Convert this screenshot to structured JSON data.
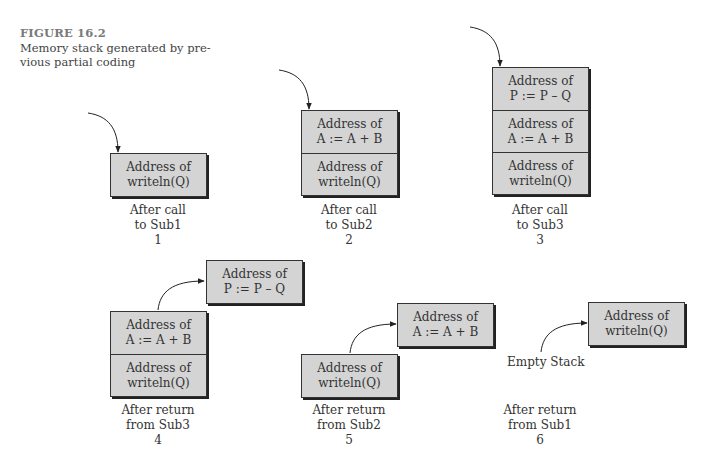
{
  "figure": {
    "title": "FIGURE 16.2",
    "caption_line1": "Memory stack generated by pre-",
    "caption_line2": "vious partial coding"
  },
  "colors": {
    "box_fill": "#d4d4d4",
    "border": "#333333",
    "text": "#333333",
    "title": "#7a7a7a"
  },
  "panels": [
    {
      "id": 1,
      "stack": [
        {
          "line1": "Address of",
          "line2": "writeln(Q)"
        }
      ],
      "caption": {
        "line1": "After call",
        "line2": "to Sub1",
        "number": "1"
      }
    },
    {
      "id": 2,
      "stack": [
        {
          "line1": "Address of",
          "line2": "A := A + B"
        },
        {
          "line1": "Address of",
          "line2": "writeln(Q)"
        }
      ],
      "caption": {
        "line1": "After call",
        "line2": "to Sub2",
        "number": "2"
      }
    },
    {
      "id": 3,
      "stack": [
        {
          "line1": "Address of",
          "line2": "P := P – Q"
        },
        {
          "line1": "Address of",
          "line2": "A := A + B"
        },
        {
          "line1": "Address of",
          "line2": "writeln(Q)"
        }
      ],
      "caption": {
        "line1": "After call",
        "line2": "to Sub3",
        "number": "3"
      }
    },
    {
      "id": 4,
      "popped": {
        "line1": "Address of",
        "line2": "P := P – Q"
      },
      "stack": [
        {
          "line1": "Address of",
          "line2": "A := A + B"
        },
        {
          "line1": "Address of",
          "line2": "writeln(Q)"
        }
      ],
      "caption": {
        "line1": "After return",
        "line2": "from Sub3",
        "number": "4"
      }
    },
    {
      "id": 5,
      "popped": {
        "line1": "Address of",
        "line2": "A := A + B"
      },
      "stack": [
        {
          "line1": "Address of",
          "line2": "writeln(Q)"
        }
      ],
      "caption": {
        "line1": "After return",
        "line2": "from Sub2",
        "number": "5"
      }
    },
    {
      "id": 6,
      "popped": {
        "line1": "Address of",
        "line2": "writeln(Q)"
      },
      "empty_label": "Empty Stack",
      "caption": {
        "line1": "After return",
        "line2": "from Sub1",
        "number": "6"
      }
    }
  ]
}
